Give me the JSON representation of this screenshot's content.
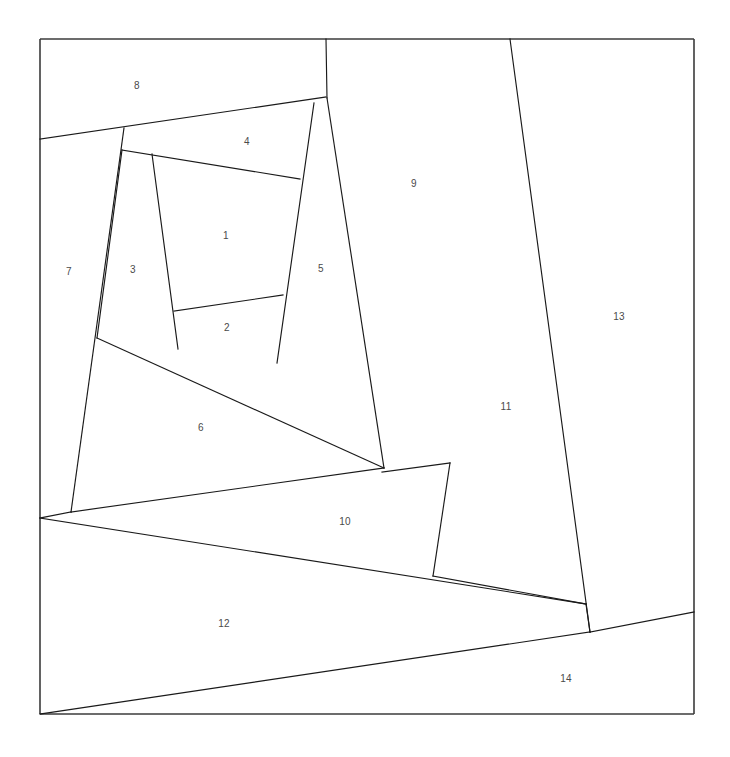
{
  "figure": {
    "title": "",
    "width": 730,
    "height": 757,
    "background_color": "#ffffff",
    "line_color": "#1a1a1a",
    "frame_color": "#3b3b3b",
    "label_color": "#4a4a4a",
    "region_count": 14
  },
  "frame": {
    "name": "outer-rectangle",
    "top_left": [
      40,
      39
    ],
    "top_right": [
      694,
      39
    ],
    "bottom_right": [
      694,
      714
    ],
    "bottom_left": [
      40,
      714
    ]
  },
  "chart_data": {
    "type": "diagram",
    "subtype": "planar-polygon-partition",
    "title": "",
    "xlabel": "",
    "ylabel": "",
    "xlim": [
      40,
      694
    ],
    "ylim": [
      39,
      714
    ],
    "grid": false,
    "legend": "none",
    "regions": [
      {
        "id": 1,
        "label": "1",
        "label_pos": [
          226,
          235
        ],
        "polygon": [
          [
            152,
            154
          ],
          [
            300,
            179
          ],
          [
            283,
            295
          ],
          [
            174,
            311
          ]
        ]
      },
      {
        "id": 2,
        "label": "2",
        "label_pos": [
          227,
          327
        ],
        "polygon": [
          [
            174,
            311
          ],
          [
            283,
            295
          ],
          [
            277,
            363
          ],
          [
            178,
            349
          ]
        ]
      },
      {
        "id": 3,
        "label": "3",
        "label_pos": [
          133,
          269
        ],
        "polygon": [
          [
            122,
            150
          ],
          [
            152,
            154
          ],
          [
            174,
            311
          ],
          [
            178,
            349
          ],
          [
            97,
            338
          ]
        ]
      },
      {
        "id": 4,
        "label": "4",
        "label_pos": [
          247,
          141
        ],
        "polygon": [
          [
            124,
            128
          ],
          [
            326,
            97
          ],
          [
            314,
            103
          ],
          [
            300,
            179
          ],
          [
            152,
            154
          ],
          [
            122,
            150
          ]
        ]
      },
      {
        "id": 5,
        "label": "5",
        "label_pos": [
          321,
          268
        ],
        "polygon": [
          [
            314,
            103
          ],
          [
            327,
            98
          ],
          [
            384,
            468
          ],
          [
            277,
            363
          ],
          [
            283,
            295
          ],
          [
            300,
            179
          ]
        ]
      },
      {
        "id": 6,
        "label": "6",
        "label_pos": [
          201,
          427
        ],
        "polygon": [
          [
            97,
            338
          ],
          [
            178,
            349
          ],
          [
            277,
            363
          ],
          [
            384,
            468
          ],
          [
            71,
            512
          ]
        ]
      },
      {
        "id": 7,
        "label": "7",
        "label_pos": [
          69,
          271
        ],
        "polygon": [
          [
            40,
            139
          ],
          [
            124,
            128
          ],
          [
            122,
            150
          ],
          [
            97,
            338
          ],
          [
            71,
            512
          ],
          [
            40,
            518
          ]
        ]
      },
      {
        "id": 8,
        "label": "8",
        "label_pos": [
          137,
          85
        ],
        "polygon": [
          [
            40,
            39
          ],
          [
            326,
            39
          ],
          [
            326,
            97
          ],
          [
            124,
            128
          ],
          [
            40,
            139
          ]
        ]
      },
      {
        "id": 9,
        "label": "9",
        "label_pos": [
          414,
          183
        ],
        "polygon": [
          [
            326,
            39
          ],
          [
            510,
            39
          ],
          [
            450,
            463
          ],
          [
            382,
            472
          ],
          [
            327,
            98
          ]
        ]
      },
      {
        "id": 10,
        "label": "10",
        "label_pos": [
          345,
          521
        ],
        "polygon": [
          [
            40,
            518
          ],
          [
            384,
            468
          ],
          [
            382,
            472
          ],
          [
            450,
            463
          ],
          [
            433,
            576
          ],
          [
            586,
            604
          ],
          [
            40,
            518
          ]
        ]
      },
      {
        "id": 11,
        "label": "11",
        "label_pos": [
          506,
          406
        ],
        "polygon": [
          [
            510,
            39
          ],
          [
            590,
            632
          ],
          [
            586,
            604
          ],
          [
            433,
            576
          ],
          [
            450,
            463
          ]
        ]
      },
      {
        "id": 12,
        "label": "12",
        "label_pos": [
          224,
          623
        ],
        "polygon": [
          [
            40,
            518
          ],
          [
            586,
            604
          ],
          [
            590,
            632
          ],
          [
            40,
            714
          ]
        ]
      },
      {
        "id": 13,
        "label": "13",
        "label_pos": [
          619,
          316
        ],
        "polygon": [
          [
            510,
            39
          ],
          [
            694,
            39
          ],
          [
            694,
            612
          ],
          [
            590,
            632
          ]
        ]
      },
      {
        "id": 14,
        "label": "14",
        "label_pos": [
          566,
          678
        ],
        "polygon": [
          [
            590,
            632
          ],
          [
            694,
            612
          ],
          [
            694,
            714
          ],
          [
            40,
            714
          ]
        ]
      }
    ],
    "edges": [
      {
        "name": "edge-frame-top",
        "from": [
          40,
          39
        ],
        "to": [
          694,
          39
        ]
      },
      {
        "name": "edge-frame-right",
        "from": [
          694,
          39
        ],
        "to": [
          694,
          714
        ]
      },
      {
        "name": "edge-frame-bottom",
        "from": [
          694,
          714
        ],
        "to": [
          40,
          714
        ]
      },
      {
        "name": "edge-frame-left",
        "from": [
          40,
          714
        ],
        "to": [
          40,
          39
        ]
      },
      {
        "name": "edge-8-bottom",
        "from": [
          40,
          139
        ],
        "to": [
          326,
          97
        ]
      },
      {
        "name": "edge-9-left-upper",
        "from": [
          326,
          39
        ],
        "to": [
          327,
          98
        ]
      },
      {
        "name": "edge-9-left-lower",
        "from": [
          327,
          98
        ],
        "to": [
          384,
          468
        ]
      },
      {
        "name": "edge-5-left",
        "from": [
          314,
          103
        ],
        "to": [
          277,
          363
        ]
      },
      {
        "name": "edge-4-bottom",
        "from": [
          122,
          150
        ],
        "to": [
          300,
          179
        ]
      },
      {
        "name": "edge-3-left",
        "from": [
          122,
          150
        ],
        "to": [
          97,
          338
        ]
      },
      {
        "name": "edge-3-right",
        "from": [
          152,
          154
        ],
        "to": [
          178,
          349
        ]
      },
      {
        "name": "edge-1-bottom",
        "from": [
          174,
          311
        ],
        "to": [
          283,
          295
        ]
      },
      {
        "name": "edge-7-right",
        "from": [
          124,
          128
        ],
        "to": [
          71,
          512
        ]
      },
      {
        "name": "edge-6-top",
        "from": [
          97,
          338
        ],
        "to": [
          384,
          468
        ]
      },
      {
        "name": "edge-6-bottom",
        "from": [
          71,
          512
        ],
        "to": [
          384,
          468
        ]
      },
      {
        "name": "edge-7-foot",
        "from": [
          71,
          512
        ],
        "to": [
          40,
          518
        ]
      },
      {
        "name": "edge-10-top",
        "from": [
          382,
          472
        ],
        "to": [
          450,
          463
        ]
      },
      {
        "name": "edge-11-left",
        "from": [
          450,
          463
        ],
        "to": [
          433,
          576
        ]
      },
      {
        "name": "edge-10-bottom",
        "from": [
          433,
          576
        ],
        "to": [
          586,
          604
        ]
      },
      {
        "name": "edge-10-left",
        "from": [
          40,
          518
        ],
        "to": [
          586,
          604
        ]
      },
      {
        "name": "edge-11-right",
        "from": [
          510,
          39
        ],
        "to": [
          590,
          632
        ]
      },
      {
        "name": "edge-11-base",
        "from": [
          586,
          604
        ],
        "to": [
          590,
          632
        ]
      },
      {
        "name": "edge-13-bottom",
        "from": [
          590,
          632
        ],
        "to": [
          694,
          612
        ]
      },
      {
        "name": "edge-12-bottom",
        "from": [
          590,
          632
        ],
        "to": [
          40,
          714
        ]
      }
    ]
  }
}
